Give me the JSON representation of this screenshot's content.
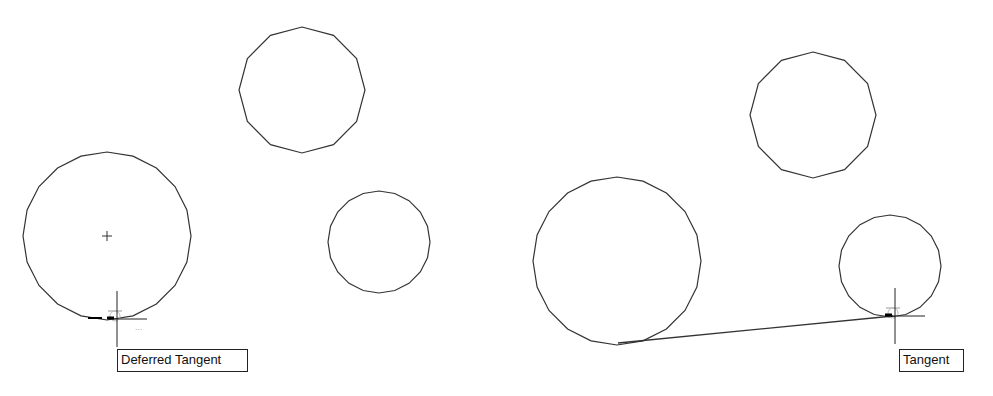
{
  "viewport": {
    "width": 993,
    "height": 396,
    "background": "#ffffff"
  },
  "colors": {
    "geometry": "#333333",
    "cursor": "#222222",
    "snap_marker": "#bbbbbb"
  },
  "left_panel": {
    "circles": [
      {
        "name": "large-circle",
        "cx": 107,
        "cy": 236,
        "r": 84,
        "sides": 20,
        "show_center_mark": true
      },
      {
        "name": "top-circle",
        "cx": 302,
        "cy": 90,
        "r": 63,
        "sides": 12,
        "show_center_mark": false
      },
      {
        "name": "small-circle",
        "cx": 379,
        "cy": 242,
        "r": 51,
        "sides": 20,
        "show_center_mark": false
      }
    ],
    "cursor": {
      "x": 117,
      "y": 319
    },
    "snap_tooltip": {
      "label": "Deferred Tangent",
      "x": 117,
      "y": 349,
      "width": 131
    }
  },
  "right_panel": {
    "circles": [
      {
        "name": "large-circle",
        "cx": 617,
        "cy": 261,
        "r": 84,
        "sides": 20,
        "show_center_mark": false
      },
      {
        "name": "top-circle",
        "cx": 813,
        "cy": 115,
        "r": 63,
        "sides": 12,
        "show_center_mark": false
      },
      {
        "name": "small-circle",
        "cx": 890,
        "cy": 266,
        "r": 51,
        "sides": 20,
        "show_center_mark": false
      }
    ],
    "tangent_line": {
      "x1": 618,
      "y1": 343,
      "x2": 893,
      "y2": 316
    },
    "cursor": {
      "x": 895,
      "y": 316
    },
    "snap_tooltip": {
      "label": "Tangent",
      "x": 899,
      "y": 349,
      "width": 65
    }
  }
}
